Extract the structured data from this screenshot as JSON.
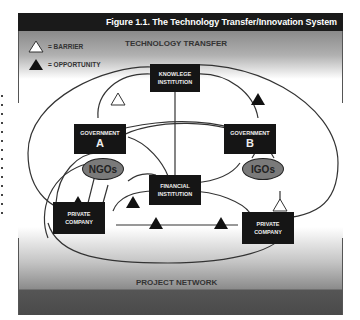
{
  "figure": {
    "title": "Figure 1.1. The Technology Transfer/Innovation System",
    "top_band_label": "TECHNOLOGY TRANSFER",
    "bottom_band_label": "PROJECT NETWORK"
  },
  "legend": {
    "items": [
      {
        "symbol": "white-triangle",
        "text": "= BARRIER"
      },
      {
        "symbol": "black-triangle",
        "text": "= OPPORTUNITY"
      }
    ]
  },
  "nodes": {
    "knowledge_institution": {
      "line1": "KNOWLEGE",
      "line2": "INSTITUTION"
    },
    "government_a": {
      "line1": "GOVERNMENT",
      "line2": "A"
    },
    "government_b": {
      "line1": "GOVERNMENT",
      "line2": "B"
    },
    "financial_institution": {
      "line1": "FINANCIAL",
      "line2": "INSTITUTION"
    },
    "private_company_left": {
      "line1": "PRIVATE",
      "line2": "COMPANY"
    },
    "private_company_right": {
      "line1": "PRIVATE",
      "line2": "COMPANY"
    }
  },
  "ovals": {
    "ngos": "NGOs",
    "igos": "IGOs"
  },
  "colors": {
    "node_fill": "#151515",
    "oval_fill": "#7a7a7a",
    "title_bar": "#1a1a1a",
    "line": "#333333"
  }
}
